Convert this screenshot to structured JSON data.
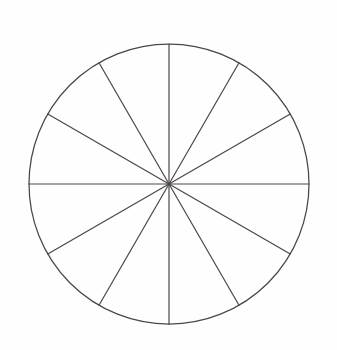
{
  "figure": {
    "background_color": "#fefefe",
    "line_color": "#4a4746",
    "line_width": 1.25
  },
  "chart_data": {
    "type": "pie",
    "subtitle": "",
    "xlabel": "",
    "ylabel": "",
    "grid": false,
    "legend_position": "none",
    "labels_shown": false,
    "values_shown": false,
    "slice_count": 12,
    "slice_angle_degrees": 30,
    "total_degrees": 360,
    "start_angle_degrees": 90,
    "direction": "clockwise",
    "categories": [
      "Sector 1",
      "Sector 2",
      "Sector 3",
      "Sector 4",
      "Sector 5",
      "Sector 6",
      "Sector 7",
      "Sector 8",
      "Sector 9",
      "Sector 10",
      "Sector 11",
      "Sector 12"
    ],
    "values": [
      30,
      30,
      30,
      30,
      30,
      30,
      30,
      30,
      30,
      30,
      30,
      30
    ],
    "fractions": [
      "1/12",
      "1/12",
      "1/12",
      "1/12",
      "1/12",
      "1/12",
      "1/12",
      "1/12",
      "1/12",
      "1/12",
      "1/12",
      "1/12"
    ],
    "percentages": [
      8.33,
      8.33,
      8.33,
      8.33,
      8.33,
      8.33,
      8.33,
      8.33,
      8.33,
      8.33,
      8.33,
      8.33
    ],
    "slice_colors": [
      "#ffffff",
      "#ffffff",
      "#ffffff",
      "#ffffff",
      "#ffffff",
      "#ffffff",
      "#ffffff",
      "#ffffff",
      "#ffffff",
      "#ffffff",
      "#ffffff",
      "#ffffff"
    ],
    "stroke_color": "#4a4746"
  },
  "geometry": {
    "center_x": 169,
    "center_y": 184,
    "radius": 140,
    "diameter_count": 6,
    "diameter_angles_degrees": [
      0,
      30,
      60,
      90,
      120,
      150
    ],
    "radius_angles_degrees": [
      0,
      30,
      60,
      90,
      120,
      150,
      180,
      210,
      240,
      270,
      300,
      330
    ]
  },
  "canvas": {
    "width": 337,
    "height": 350
  }
}
